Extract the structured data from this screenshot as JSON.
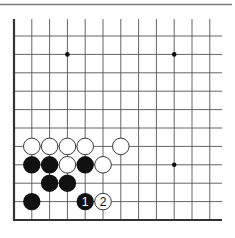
{
  "diagram": {
    "type": "go-board-diagram",
    "board_fragment": "lower-left corner",
    "columns_visible": 12,
    "rows_visible": 11,
    "edges": [
      "left",
      "bottom"
    ],
    "colors": {
      "background": "#ffffff",
      "grid": "#555555",
      "edge": "#333333",
      "top_rule": "#7a7a7a",
      "black_stone": "#111111",
      "white_stone": "#ffffff",
      "stone_outline": "#222222"
    },
    "star_points": [
      {
        "col": 3,
        "row": 1
      },
      {
        "col": 9,
        "row": 1
      },
      {
        "col": 9,
        "row": 7
      }
    ],
    "stones": [
      {
        "color": "white",
        "col": 1,
        "row": 6,
        "label": ""
      },
      {
        "color": "white",
        "col": 2,
        "row": 6,
        "label": ""
      },
      {
        "color": "white",
        "col": 3,
        "row": 6,
        "label": ""
      },
      {
        "color": "white",
        "col": 4,
        "row": 6,
        "label": ""
      },
      {
        "color": "white",
        "col": 6,
        "row": 6,
        "label": ""
      },
      {
        "color": "black",
        "col": 1,
        "row": 7,
        "label": ""
      },
      {
        "color": "black",
        "col": 2,
        "row": 7,
        "label": ""
      },
      {
        "color": "white",
        "col": 3,
        "row": 7,
        "label": ""
      },
      {
        "color": "black",
        "col": 4,
        "row": 7,
        "label": ""
      },
      {
        "color": "white",
        "col": 5,
        "row": 7,
        "label": ""
      },
      {
        "color": "black",
        "col": 2,
        "row": 8,
        "label": ""
      },
      {
        "color": "black",
        "col": 3,
        "row": 8,
        "label": ""
      },
      {
        "color": "black",
        "col": 1,
        "row": 9,
        "label": ""
      },
      {
        "color": "black",
        "col": 4,
        "row": 9,
        "label": "1"
      },
      {
        "color": "white",
        "col": 5,
        "row": 9,
        "label": "2"
      }
    ],
    "move_labels": {
      "move1": "1",
      "move2": "2"
    }
  }
}
